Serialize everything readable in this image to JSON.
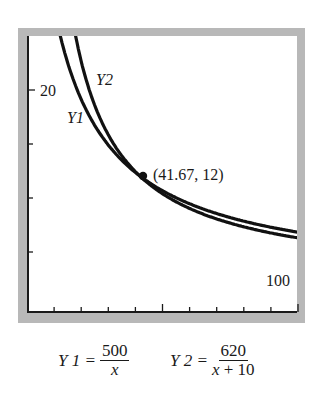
{
  "chart_data": {
    "type": "line",
    "title": "",
    "xlabel": "",
    "ylabel": "",
    "xlim": [
      0,
      100
    ],
    "ylim": [
      0,
      25
    ],
    "grid": false,
    "x_tick_count": 10,
    "y_tick_count": 4,
    "tick_labels": {
      "y_label": "20",
      "x_label": "100"
    },
    "series": [
      {
        "name": "Y1",
        "formula": "500/x",
        "x": [
          18,
          20,
          25,
          30,
          41.67,
          50,
          60,
          70,
          80,
          90,
          100
        ],
        "values": [
          27.78,
          25,
          20,
          16.67,
          12,
          10,
          8.33,
          7.14,
          6.25,
          5.56,
          5
        ]
      },
      {
        "name": "Y2",
        "formula": "620/(x+10)",
        "x": [
          14,
          20,
          25,
          30,
          41.67,
          50,
          60,
          70,
          80,
          90,
          100
        ],
        "values": [
          25.83,
          20.67,
          17.71,
          15.5,
          12,
          10.33,
          8.86,
          7.75,
          6.89,
          6.2,
          5.64
        ]
      }
    ],
    "annotations": [
      {
        "text": "(41.67, 12)",
        "x": 41.67,
        "y": 12,
        "marker": "dot"
      }
    ]
  },
  "labels": {
    "y20": "20",
    "x100": "100",
    "y1": "Y1",
    "y2": "Y2",
    "point": "(41.67, 12)"
  },
  "formulas": {
    "y1": {
      "lhs": "Y 1 =",
      "num": "500",
      "den": "x"
    },
    "y2": {
      "lhs": "Y 2 =",
      "num": "620",
      "den_var": "x",
      "den_rest": " + 10"
    }
  },
  "colors": {
    "curve": "#111111",
    "frame": "#b8b8b8",
    "axis": "#1a1a1a"
  }
}
